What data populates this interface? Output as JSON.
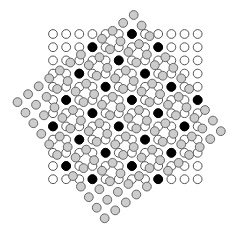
{
  "diagram": {
    "width": 240,
    "height": 236,
    "circle_radius": 4.4,
    "stroke_width": 1,
    "colors": {
      "background": "#ffffff",
      "lattice_a_fill": "#ffffff",
      "lattice_a_stroke": "#555555",
      "lattice_b_fill": "#cccccc",
      "lattice_b_stroke": "#666666",
      "coincidence_fill": "#000000",
      "coincidence_stroke": "#000000"
    },
    "lattice_a": {
      "name": "reference-lattice",
      "rows": 12,
      "cols": 12,
      "origin": [
        53.0,
        34.0
      ],
      "u": [
        13.15,
        0
      ],
      "v": [
        0,
        13.2
      ]
    },
    "lattice_b": {
      "name": "rotated-lattice",
      "rows": 12,
      "cols": 12,
      "rotation_deg": 53.13,
      "origin": [
        133.7,
        15.0
      ],
      "u": [
        7.92,
        10.56
      ],
      "v": [
        -10.56,
        7.92
      ]
    },
    "coincidence_tolerance": 3.0
  }
}
